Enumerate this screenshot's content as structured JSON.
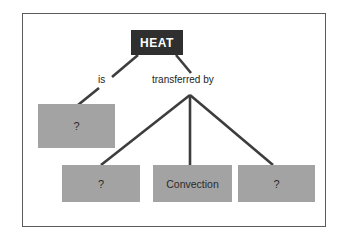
{
  "diagram": {
    "type": "concept-map",
    "background_color": "#ffffff",
    "frame": {
      "border_color": "#5b5b5b",
      "fill_color": "#ffffff"
    },
    "colors": {
      "root_box_fill": "#2f2f2f",
      "root_box_text": "#ffffff",
      "node_box_fill": "#a3a3a3",
      "node_box_text": "#2a2a2a",
      "connector": "#3d3d3d"
    },
    "nodes": [
      {
        "id": "root",
        "label": "HEAT",
        "style": "dark"
      },
      {
        "id": "property",
        "label": "?",
        "style": "gray"
      },
      {
        "id": "transfer-1",
        "label": "?",
        "style": "gray"
      },
      {
        "id": "transfer-2",
        "label": "Convection",
        "style": "gray"
      },
      {
        "id": "transfer-3",
        "label": "?",
        "style": "gray"
      }
    ],
    "edge_labels": [
      {
        "id": "is",
        "label": "is"
      },
      {
        "id": "transferred-by",
        "label": "transferred by"
      }
    ]
  }
}
